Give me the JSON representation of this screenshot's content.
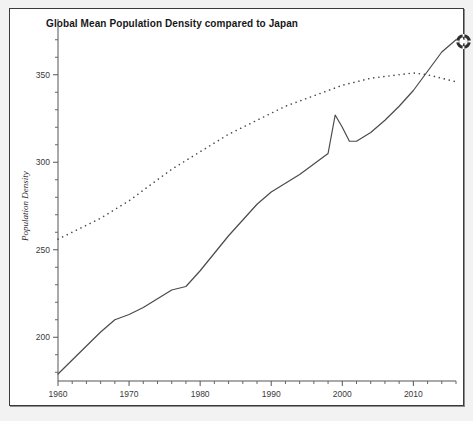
{
  "window": {
    "background_color": "#f2f2f2",
    "frame_border_color": "#3b3b3b"
  },
  "title": "Global Mean Population Density compared to Japan",
  "status_icon": {
    "name": "spinner-gear-icon",
    "color": "#2e2e2e"
  },
  "chart_data": {
    "type": "line",
    "title": "Global Mean Population Density compared to Japan",
    "xlabel": "Year",
    "ylabel": "Population Density",
    "xlim": [
      1960,
      2016
    ],
    "ylim": [
      175,
      375
    ],
    "xticks": [
      1960,
      1970,
      1980,
      1990,
      2000,
      2010
    ],
    "yticks": [
      200,
      250,
      300,
      350
    ],
    "xtick_labels": [
      "1960",
      "1970",
      "1980",
      "1990",
      "2000",
      "2010"
    ],
    "ytick_labels": [
      "200",
      "250",
      "300",
      "350"
    ],
    "minor_ticks": true,
    "grid": false,
    "legend": null,
    "line_color": "#4a4a50",
    "dotted_color": "#4a4a50",
    "series": [
      {
        "name": "Global Mean Population Density",
        "style": "solid",
        "x": [
          1960,
          1962,
          1964,
          1966,
          1968,
          1970,
          1972,
          1974,
          1976,
          1978,
          1980,
          1982,
          1984,
          1986,
          1988,
          1990,
          1992,
          1994,
          1996,
          1998,
          1999,
          2000,
          2001,
          2002,
          2004,
          2006,
          2008,
          2010,
          2012,
          2014,
          2016
        ],
        "y": [
          179,
          187,
          195,
          203,
          210,
          213,
          217,
          222,
          227,
          229,
          238,
          248,
          258,
          267,
          276,
          283,
          288,
          293,
          299,
          305,
          327,
          320,
          312,
          312,
          317,
          324,
          332,
          341,
          352,
          363,
          370
        ]
      },
      {
        "name": "Japan Population Density",
        "style": "dotted",
        "x": [
          1960,
          1962,
          1964,
          1966,
          1968,
          1970,
          1972,
          1974,
          1976,
          1978,
          1980,
          1982,
          1984,
          1986,
          1988,
          1990,
          1992,
          1994,
          1996,
          1998,
          2000,
          2002,
          2004,
          2006,
          2008,
          2010,
          2012,
          2014,
          2016
        ],
        "y": [
          256,
          260,
          264,
          268,
          273,
          278,
          284,
          290,
          296,
          301,
          306,
          311,
          316,
          320,
          324,
          328,
          332,
          335,
          338,
          341,
          344,
          346,
          348,
          349,
          350,
          351,
          350,
          348,
          346
        ]
      }
    ]
  }
}
